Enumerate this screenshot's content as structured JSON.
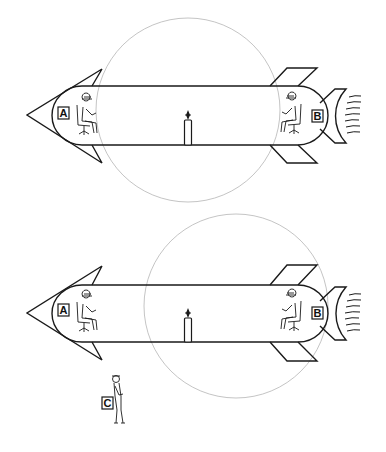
{
  "diagram": {
    "colors": {
      "stroke": "#1a1a1a",
      "circle": "#b5b5b5",
      "background": "#ffffff"
    },
    "panels": [
      {
        "id": "top",
        "rocket": {
          "body_top": 86,
          "body_bottom": 145,
          "left_x": 52,
          "right_x": 328
        },
        "circle": {
          "cx": 188,
          "cy": 110,
          "r": 92
        },
        "labels": {
          "front_observer": "A",
          "rear_observer": "B"
        }
      },
      {
        "id": "bottom",
        "rocket": {
          "body_top": 285,
          "body_bottom": 342,
          "left_x": 52,
          "right_x": 328
        },
        "circle": {
          "cx": 236,
          "cy": 306,
          "r": 92
        },
        "labels": {
          "front_observer": "A",
          "rear_observer": "B"
        }
      }
    ],
    "external_observer": {
      "label": "C"
    }
  }
}
